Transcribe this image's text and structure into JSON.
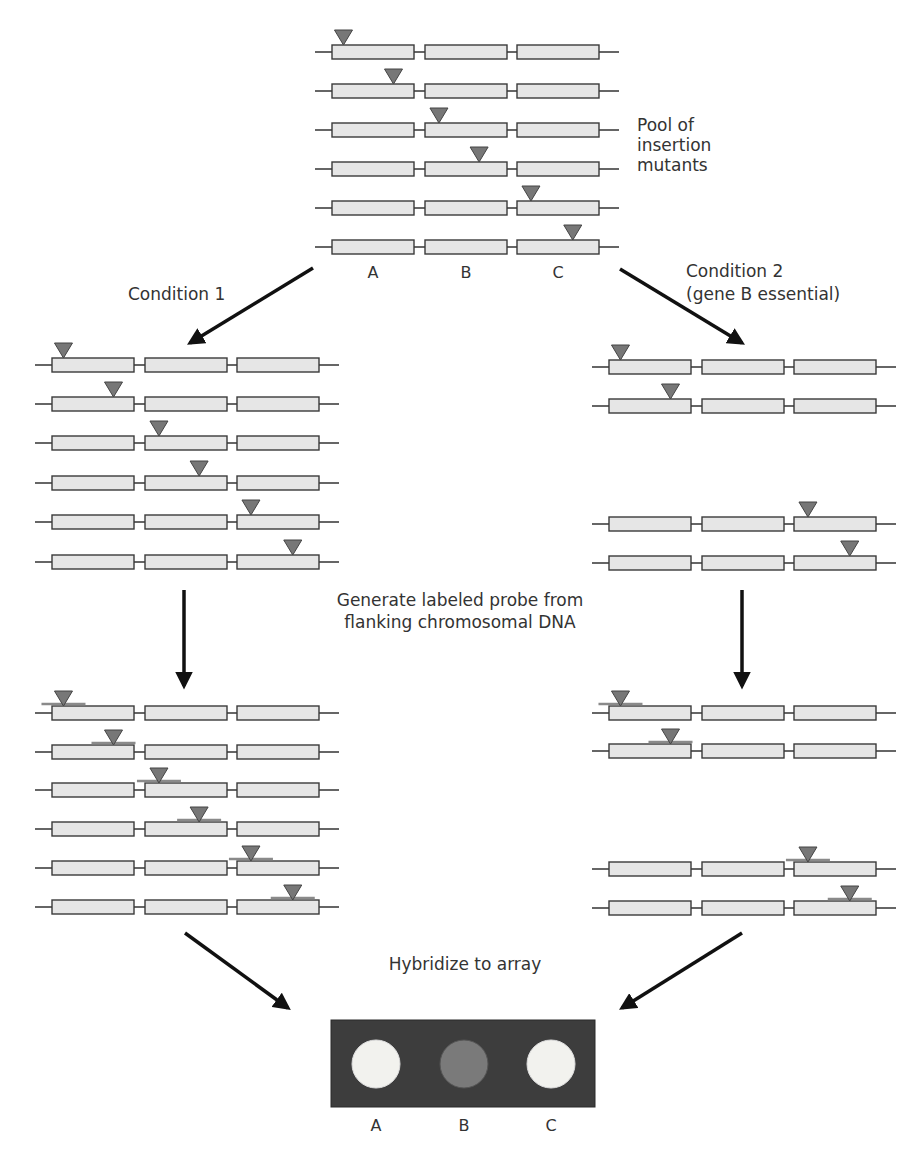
{
  "colors": {
    "box_fill": "#e6e6e6",
    "box_stroke": "#3a3a3a",
    "line": "#333333",
    "insertion": "#777777",
    "insertion_stroke": "#444444",
    "probe": "#8a8a8a",
    "arrow": "#111111",
    "array_bg": "#3d3d3d",
    "spot_bright": "#f2f2ee",
    "spot_dim": "#7a7a7a"
  },
  "genes": [
    "A",
    "B",
    "C"
  ],
  "pool": {
    "label": "Pool of\ninsertion\nmutants",
    "label_lines": [
      "Pool of",
      "insertion",
      "mutants"
    ],
    "origin_x": 315,
    "rows_y": [
      52,
      91,
      130,
      169,
      208,
      247
    ],
    "insertions": [
      {
        "gene": "A",
        "pos": 0.14
      },
      {
        "gene": "A",
        "pos": 0.75
      },
      {
        "gene": "B",
        "pos": 0.17
      },
      {
        "gene": "B",
        "pos": 0.66
      },
      {
        "gene": "C",
        "pos": 0.17
      },
      {
        "gene": "C",
        "pos": 0.68
      }
    ],
    "gene_labels_y": 263
  },
  "conditions": {
    "condition1": {
      "label": "Condition 1"
    },
    "condition2": {
      "label_lines": [
        "Condition 2",
        "(gene B essential)"
      ]
    }
  },
  "left_selected": {
    "origin_x": 35,
    "rows_y": [
      365,
      404,
      443,
      483,
      522,
      562
    ],
    "insertions": [
      {
        "gene": "A",
        "pos": 0.14
      },
      {
        "gene": "A",
        "pos": 0.75
      },
      {
        "gene": "B",
        "pos": 0.17
      },
      {
        "gene": "B",
        "pos": 0.66
      },
      {
        "gene": "C",
        "pos": 0.17
      },
      {
        "gene": "C",
        "pos": 0.68
      }
    ]
  },
  "right_selected": {
    "origin_x": 592,
    "rows_y": [
      367,
      406,
      524,
      563
    ],
    "insertions": [
      {
        "gene": "A",
        "pos": 0.14
      },
      {
        "gene": "A",
        "pos": 0.75
      },
      {
        "gene": "C",
        "pos": 0.17
      },
      {
        "gene": "C",
        "pos": 0.68
      }
    ]
  },
  "probe_step": {
    "label_lines": [
      "Generate labeled probe from",
      "flanking chromosomal DNA"
    ]
  },
  "left_probed": {
    "origin_x": 35,
    "rows_y": [
      713,
      752,
      790,
      829,
      868,
      907
    ],
    "insertions": [
      {
        "gene": "A",
        "pos": 0.14
      },
      {
        "gene": "A",
        "pos": 0.75
      },
      {
        "gene": "B",
        "pos": 0.17
      },
      {
        "gene": "B",
        "pos": 0.66
      },
      {
        "gene": "C",
        "pos": 0.17
      },
      {
        "gene": "C",
        "pos": 0.68
      }
    ]
  },
  "right_probed": {
    "origin_x": 592,
    "rows_y": [
      713,
      751,
      869,
      908
    ],
    "insertions": [
      {
        "gene": "A",
        "pos": 0.14
      },
      {
        "gene": "A",
        "pos": 0.75
      },
      {
        "gene": "C",
        "pos": 0.17
      },
      {
        "gene": "C",
        "pos": 0.68
      }
    ]
  },
  "hybridize": {
    "label": "Hybridize to array"
  },
  "array": {
    "spots": [
      {
        "gene": "A",
        "intensity": "bright"
      },
      {
        "gene": "B",
        "intensity": "dim"
      },
      {
        "gene": "C",
        "intensity": "bright"
      }
    ]
  }
}
